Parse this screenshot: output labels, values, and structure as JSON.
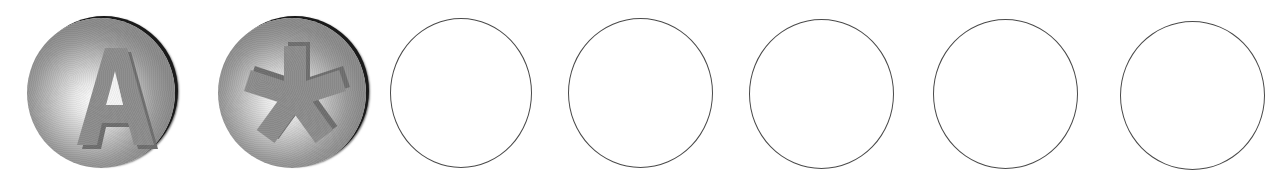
{
  "balls": [
    {
      "glyph": "A",
      "icon": "letter-a-icon",
      "x": 27,
      "y": 18,
      "w": 148,
      "h": 150,
      "face_color": "#8c8c8c",
      "bevel_color": "#6e6e6e"
    },
    {
      "glyph": "*",
      "icon": "asterisk-icon",
      "x": 218,
      "y": 18,
      "w": 148,
      "h": 150,
      "face_color": "#8c8c8c",
      "bevel_color": "#6e6e6e"
    }
  ],
  "rings": [
    {
      "x": 390,
      "y": 18,
      "w": 142,
      "h": 150
    },
    {
      "x": 568,
      "y": 18,
      "w": 145,
      "h": 150
    },
    {
      "x": 749,
      "y": 19,
      "w": 145,
      "h": 150
    },
    {
      "x": 933,
      "y": 19,
      "w": 145,
      "h": 150
    },
    {
      "x": 1120,
      "y": 21,
      "w": 145,
      "h": 149
    }
  ],
  "colors": {
    "ring_stroke": "#4a4a4a",
    "background": "#ffffff",
    "ball_shadow": "#1a1a1a"
  }
}
